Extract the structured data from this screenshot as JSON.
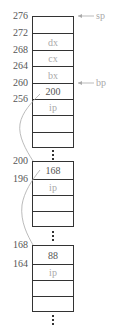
{
  "blocks": [
    {
      "top": 16,
      "rows": [
        {
          "label": "",
          "height": 17
        },
        {
          "label": "dx",
          "height": 17
        },
        {
          "label": "cx",
          "height": 16
        },
        {
          "label": "bx",
          "height": 17
        },
        {
          "label": "200",
          "height": 16
        },
        {
          "label": "ip",
          "height": 16
        },
        {
          "label": "",
          "height": 17
        },
        {
          "label": "",
          "height": 15
        }
      ]
    },
    {
      "top": 161,
      "rows": [
        {
          "label": "168",
          "height": 18
        },
        {
          "label": "ip",
          "height": 16
        },
        {
          "label": "",
          "height": 16
        },
        {
          "label": "",
          "height": 15
        }
      ]
    },
    {
      "top": 245,
      "rows": [
        {
          "label": "88",
          "height": 19
        },
        {
          "label": "ip",
          "height": 16
        },
        {
          "label": "",
          "height": 16
        },
        {
          "label": "",
          "height": 15
        }
      ]
    }
  ],
  "addresses": [
    {
      "label": "276",
      "y": 16
    },
    {
      "label": "272",
      "y": 33
    },
    {
      "label": "268",
      "y": 50
    },
    {
      "label": "264",
      "y": 66
    },
    {
      "label": "260",
      "y": 83
    },
    {
      "label": "256",
      "y": 99
    },
    {
      "label": "200",
      "y": 161
    },
    {
      "label": "196",
      "y": 179
    },
    {
      "label": "168",
      "y": 245
    },
    {
      "label": "164",
      "y": 264
    }
  ],
  "pointers": [
    {
      "label": "sp",
      "y": 16
    },
    {
      "label": "bp",
      "y": 83
    }
  ],
  "addr_labels": [
    "276",
    "272",
    "268",
    "264",
    "260",
    "256",
    "200",
    "196",
    "168",
    "164"
  ],
  "cell_labels": {
    "b1": [
      "",
      "dx",
      "cx",
      "bx",
      "200",
      "ip",
      "",
      ""
    ],
    "b2": [
      "168",
      "ip",
      "",
      ""
    ],
    "b3": [
      "88",
      "ip",
      "",
      ""
    ]
  },
  "pointer_labels": {
    "sp": "sp",
    "bp": "bp"
  }
}
